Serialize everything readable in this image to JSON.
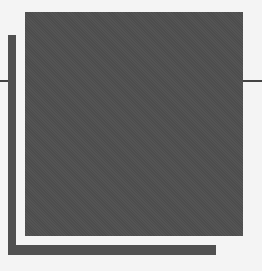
{
  "figure": {
    "colors": {
      "background": "#f4f4f4",
      "square": "#4d4d4d",
      "bars": "#505050",
      "ticks": "#444444"
    }
  }
}
